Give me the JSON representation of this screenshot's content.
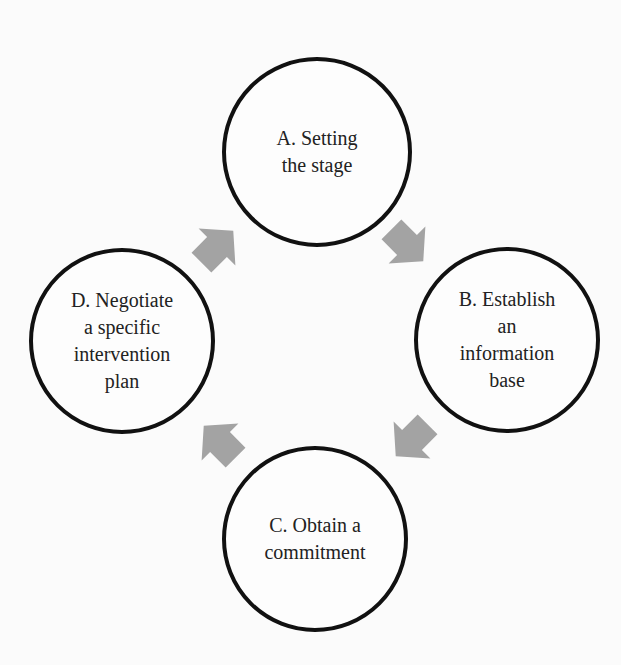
{
  "diagram": {
    "type": "cycle",
    "nodes": [
      {
        "id": "A",
        "label": "A. Setting\nthe stage",
        "cx": 317,
        "cy": 152,
        "r": 95
      },
      {
        "id": "B",
        "label": "B. Establish\nan\ninformation\nbase",
        "cx": 507,
        "cy": 340,
        "r": 93
      },
      {
        "id": "C",
        "label": "C. Obtain a\ncommitment",
        "cx": 315,
        "cy": 539,
        "r": 93
      },
      {
        "id": "D",
        "label": "D. Negotiate\na specific\nintervention\nplan",
        "cx": 122,
        "cy": 341,
        "r": 93
      }
    ],
    "edges": [
      {
        "from": "A",
        "to": "B",
        "cx": 407,
        "cy": 245,
        "angle": 45
      },
      {
        "from": "B",
        "to": "C",
        "cx": 412,
        "cy": 440,
        "angle": 135
      },
      {
        "from": "C",
        "to": "D",
        "cx": 220,
        "cy": 442,
        "angle": 225
      },
      {
        "from": "D",
        "to": "A",
        "cx": 217,
        "cy": 247,
        "angle": -45
      }
    ],
    "colors": {
      "background": "#fbfbfb",
      "circle_stroke": "#111111",
      "arrow_fill": "#a3a3a3",
      "text": "#222222"
    }
  }
}
